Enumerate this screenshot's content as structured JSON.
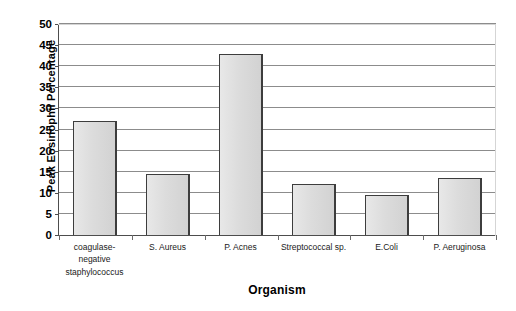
{
  "chart_data": {
    "type": "bar",
    "title": "",
    "xlabel": "Organism",
    "ylabel": "Peak Eosinophil Percentage",
    "categories": [
      "coagulase-negative staphylococcus",
      "S. Aureus",
      "P. Acnes",
      "Streptococcal sp.",
      "E.Coli",
      "P. Aeruginosa"
    ],
    "category_lines": [
      [
        "coagulase-",
        "negative",
        "staphylococcus"
      ],
      [
        "S. Aureus"
      ],
      [
        "P. Acnes"
      ],
      [
        "Streptococcal sp."
      ],
      [
        "E.Coli"
      ],
      [
        "P. Aeruginosa"
      ]
    ],
    "values": [
      27,
      14.5,
      43,
      12,
      9.5,
      13.5
    ],
    "ylim": [
      0,
      50
    ],
    "ytick_step": 5,
    "yticks": [
      0,
      5,
      10,
      15,
      20,
      25,
      30,
      35,
      40,
      45,
      50
    ],
    "ytick_labels": [
      "0",
      "5",
      "10",
      "15",
      "20",
      "25",
      "30",
      "35",
      "40",
      "45",
      "50"
    ],
    "grid": true,
    "legend": false,
    "bar_fill_color": "#dcdcdc",
    "bar_border_color": "#3d3d3d",
    "gridline_color": "#8c8c8c",
    "axis_color": "#4d4d4d",
    "text_color": "#000000"
  }
}
